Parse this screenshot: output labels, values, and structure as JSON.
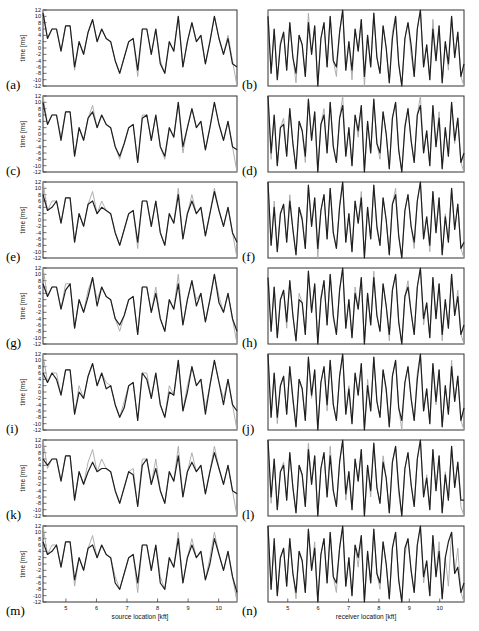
{
  "figure": {
    "background": "#ffffff",
    "colors": {
      "black_line": "#1f1f1f",
      "gray_line": "#ababab",
      "axis": "#333333"
    }
  },
  "chart_data": {
    "type": "line",
    "panels_layout": "7 rows x 2 columns, labels (a)-(n)",
    "grid": "off",
    "legend": "none",
    "ylabel": "time [ms]",
    "ylim": [
      -12,
      12
    ],
    "yticks": [
      12,
      10,
      8,
      6,
      4,
      2,
      0,
      -2,
      -4,
      -6,
      -8,
      -10,
      -12
    ],
    "xticks": [
      5,
      6,
      7,
      8,
      9,
      10
    ],
    "columns": [
      {
        "role": "left",
        "xlabel": "source location [kft]",
        "x_range": [
          4.25,
          10.6
        ],
        "gray_values": [
          12,
          3,
          6,
          6,
          -1,
          7,
          7,
          -7,
          2,
          -2,
          5,
          9,
          2,
          6,
          3,
          2,
          -4,
          -8,
          -3,
          2,
          3,
          -9,
          6,
          6,
          -2,
          6,
          -4,
          -8,
          2,
          -1,
          10,
          -6,
          2,
          8,
          2,
          4,
          -5,
          2,
          10,
          3,
          -2,
          4,
          -4,
          -12
        ]
      },
      {
        "role": "right",
        "xlabel": "receiver location [kft]",
        "x_range": [
          4.35,
          10.8
        ],
        "gray_values": [
          12,
          -8,
          6,
          -10,
          2,
          5,
          -7,
          8,
          -3,
          -11,
          4,
          1,
          -9,
          11,
          -2,
          7,
          -12,
          3,
          8,
          -6,
          10,
          -4,
          -9,
          5,
          12,
          -7,
          2,
          -10,
          6,
          -1,
          9,
          -12,
          4,
          -6,
          11,
          -3,
          -8,
          7,
          0,
          -11,
          5,
          10,
          -5,
          -12,
          3,
          8,
          -2,
          -9,
          6,
          12,
          -6,
          1,
          -10,
          9,
          -4,
          7,
          -11,
          2,
          -7,
          10,
          -3,
          5,
          -9,
          -12
        ]
      }
    ],
    "panels": [
      {
        "label": "(a)",
        "column": 0,
        "black_overrides": [
          [
            0,
            11
          ],
          [
            7,
            -6
          ],
          [
            21,
            -7
          ],
          [
            26,
            -5
          ],
          [
            41,
            3
          ],
          [
            42,
            -5
          ],
          [
            43,
            -6
          ]
        ]
      },
      {
        "label": "(b)",
        "column": 1,
        "black_overrides": [
          [
            0,
            10
          ],
          [
            4,
            1
          ],
          [
            9,
            -8
          ],
          [
            13,
            8
          ],
          [
            22,
            -6
          ],
          [
            27,
            -7
          ],
          [
            31,
            -9
          ],
          [
            40,
            3
          ],
          [
            46,
            1
          ],
          [
            53,
            6
          ],
          [
            58,
            -5
          ],
          [
            63,
            -5
          ]
        ]
      },
      {
        "label": "(c)",
        "column": 0,
        "black_overrides": [
          [
            0,
            10
          ],
          [
            4,
            -2
          ],
          [
            11,
            7
          ],
          [
            17,
            -7
          ],
          [
            22,
            5
          ],
          [
            27,
            -7
          ],
          [
            31,
            -4
          ],
          [
            43,
            -5
          ]
        ]
      },
      {
        "label": "(d)",
        "column": 1,
        "black_overrides": [
          [
            1,
            -6
          ],
          [
            5,
            3
          ],
          [
            12,
            -7
          ],
          [
            18,
            6
          ],
          [
            24,
            9
          ],
          [
            29,
            1
          ],
          [
            36,
            -6
          ],
          [
            44,
            2
          ],
          [
            49,
            9
          ],
          [
            55,
            5
          ],
          [
            60,
            -2
          ],
          [
            63,
            -6
          ]
        ]
      },
      {
        "label": "(e)",
        "column": 0,
        "black_overrides": [
          [
            0,
            8
          ],
          [
            2,
            4
          ],
          [
            11,
            6
          ],
          [
            13,
            4
          ],
          [
            21,
            -7
          ],
          [
            30,
            8
          ],
          [
            33,
            6
          ],
          [
            38,
            9
          ],
          [
            43,
            -7
          ]
        ]
      },
      {
        "label": "(f)",
        "column": 1,
        "black_overrides": [
          [
            2,
            4
          ],
          [
            7,
            6
          ],
          [
            11,
            0
          ],
          [
            16,
            -9
          ],
          [
            23,
            4
          ],
          [
            30,
            7
          ],
          [
            35,
            -2
          ],
          [
            41,
            8
          ],
          [
            47,
            -7
          ],
          [
            52,
            -8
          ],
          [
            57,
            1
          ],
          [
            63,
            -7
          ]
        ]
      },
      {
        "label": "(g)",
        "column": 0,
        "black_overrides": [
          [
            0,
            7
          ],
          [
            5,
            5
          ],
          [
            10,
            3
          ],
          [
            12,
            0
          ],
          [
            17,
            -6
          ],
          [
            25,
            4
          ],
          [
            30,
            7
          ],
          [
            34,
            0
          ],
          [
            39,
            1
          ],
          [
            43,
            -8
          ]
        ]
      },
      {
        "label": "(h)",
        "column": 1,
        "black_overrides": [
          [
            0,
            9
          ],
          [
            6,
            -5
          ],
          [
            10,
            2
          ],
          [
            17,
            2
          ],
          [
            21,
            -3
          ],
          [
            28,
            4
          ],
          [
            34,
            9
          ],
          [
            39,
            -9
          ],
          [
            45,
            6
          ],
          [
            50,
            -4
          ],
          [
            56,
            -9
          ],
          [
            61,
            3
          ],
          [
            63,
            -6
          ]
        ]
      },
      {
        "label": "(i)",
        "column": 0,
        "black_overrides": [
          [
            0,
            6
          ],
          [
            3,
            4
          ],
          [
            8,
            0
          ],
          [
            14,
            1
          ],
          [
            18,
            -5
          ],
          [
            23,
            4
          ],
          [
            28,
            0
          ],
          [
            32,
            0
          ],
          [
            36,
            -7
          ],
          [
            40,
            -4
          ],
          [
            43,
            -6
          ]
        ]
      },
      {
        "label": "(j)",
        "column": 1,
        "black_overrides": [
          [
            3,
            -8
          ],
          [
            8,
            -2
          ],
          [
            14,
            -1
          ],
          [
            19,
            -4
          ],
          [
            26,
            1
          ],
          [
            32,
            2
          ],
          [
            38,
            1
          ],
          [
            43,
            -9
          ],
          [
            48,
            4
          ],
          [
            54,
            -3
          ],
          [
            59,
            8
          ],
          [
            63,
            -5
          ]
        ]
      },
      {
        "label": "(k)",
        "column": 0,
        "black_overrides": [
          [
            0,
            6
          ],
          [
            1,
            4
          ],
          [
            10,
            2
          ],
          [
            11,
            5
          ],
          [
            13,
            3
          ],
          [
            20,
            1
          ],
          [
            22,
            4
          ],
          [
            25,
            3
          ],
          [
            30,
            7
          ],
          [
            33,
            5
          ],
          [
            38,
            8
          ],
          [
            43,
            -5
          ]
        ]
      },
      {
        "label": "(l)",
        "column": 1,
        "black_overrides": [
          [
            1,
            -6
          ],
          [
            5,
            4
          ],
          [
            13,
            9
          ],
          [
            20,
            7
          ],
          [
            25,
            -5
          ],
          [
            33,
            -4
          ],
          [
            37,
            5
          ],
          [
            42,
            -3
          ],
          [
            51,
            0
          ],
          [
            57,
            1
          ],
          [
            62,
            -7
          ],
          [
            63,
            -7
          ]
        ]
      },
      {
        "label": "(m)",
        "column": 0,
        "black_overrides": [
          [
            0,
            7
          ],
          [
            2,
            4
          ],
          [
            7,
            -5
          ],
          [
            11,
            6
          ],
          [
            16,
            -6
          ],
          [
            21,
            -6
          ],
          [
            26,
            -6
          ],
          [
            30,
            8
          ],
          [
            33,
            6
          ],
          [
            37,
            0
          ],
          [
            38,
            8
          ],
          [
            43,
            -9
          ]
        ]
      },
      {
        "label": "(n)",
        "column": 1,
        "black_overrides": [
          [
            2,
            8
          ],
          [
            9,
            -9
          ],
          [
            15,
            5
          ],
          [
            22,
            -6
          ],
          [
            29,
            2
          ],
          [
            36,
            -6
          ],
          [
            44,
            5
          ],
          [
            50,
            -4
          ],
          [
            55,
            4
          ],
          [
            58,
            7
          ],
          [
            61,
            -1
          ],
          [
            63,
            -6
          ]
        ]
      }
    ]
  }
}
